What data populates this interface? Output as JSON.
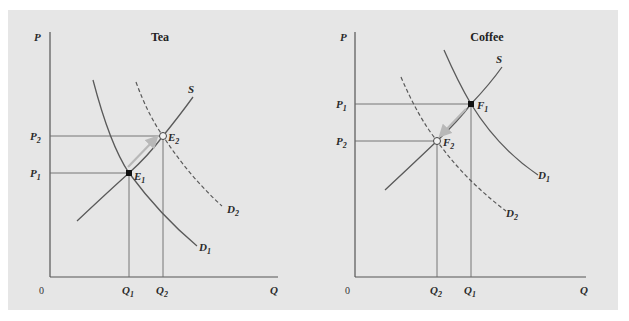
{
  "colors": {
    "background": "#e6e6e6",
    "axis": "#555555",
    "curve": "#5a5a5a",
    "guide": "#6a6a6a",
    "arrow": "#b8b8b8",
    "text": "#2a2a2a"
  },
  "tea": {
    "title": "Tea",
    "y_axis_label": "P",
    "x_axis_label": "Q",
    "origin_label": "0",
    "price_labels": [
      {
        "main": "P",
        "sub": "2"
      },
      {
        "main": "P",
        "sub": "1"
      }
    ],
    "quantity_labels": [
      {
        "main": "Q",
        "sub": "1"
      },
      {
        "main": "Q",
        "sub": "2"
      }
    ],
    "curves": {
      "supply": {
        "main": "S",
        "sub": ""
      },
      "demand_initial": {
        "main": "D",
        "sub": "1"
      },
      "demand_new": {
        "main": "D",
        "sub": "2"
      }
    },
    "points": {
      "initial": {
        "main": "E",
        "sub": "1",
        "style": "filled"
      },
      "new": {
        "main": "E",
        "sub": "2",
        "style": "hollow"
      }
    }
  },
  "coffee": {
    "title": "Coffee",
    "y_axis_label": "P",
    "x_axis_label": "Q",
    "origin_label": "0",
    "price_labels": [
      {
        "main": "P",
        "sub": "1"
      },
      {
        "main": "P",
        "sub": "2"
      }
    ],
    "quantity_labels": [
      {
        "main": "Q",
        "sub": "2"
      },
      {
        "main": "Q",
        "sub": "1"
      }
    ],
    "curves": {
      "supply": {
        "main": "S",
        "sub": ""
      },
      "demand_initial": {
        "main": "D",
        "sub": "1"
      },
      "demand_new": {
        "main": "D",
        "sub": "2"
      }
    },
    "points": {
      "initial": {
        "main": "F",
        "sub": "1",
        "style": "filled"
      },
      "new": {
        "main": "F",
        "sub": "2",
        "style": "hollow"
      }
    }
  }
}
